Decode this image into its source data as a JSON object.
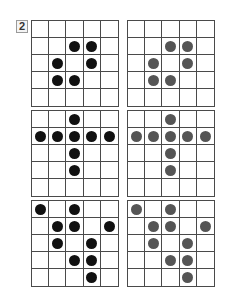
{
  "problem_number": "2",
  "colors": {
    "left_dot": "#111111",
    "right_dot": "#555555",
    "grid_line": "#4a4a4a"
  },
  "rows": [
    {
      "left": {
        "dots": [
          [
            1,
            2
          ],
          [
            1,
            3
          ],
          [
            2,
            1
          ],
          [
            2,
            3
          ],
          [
            3,
            1
          ],
          [
            3,
            2
          ]
        ]
      },
      "right": {
        "dots": [
          [
            1,
            2
          ],
          [
            1,
            3
          ],
          [
            2,
            1
          ],
          [
            2,
            3
          ],
          [
            3,
            1
          ],
          [
            3,
            2
          ]
        ]
      }
    },
    {
      "left": {
        "dots": [
          [
            0,
            2
          ],
          [
            1,
            0
          ],
          [
            1,
            1
          ],
          [
            1,
            2
          ],
          [
            1,
            3
          ],
          [
            1,
            4
          ],
          [
            2,
            2
          ],
          [
            3,
            2
          ]
        ]
      },
      "right": {
        "dots": [
          [
            0,
            2
          ],
          [
            1,
            0
          ],
          [
            1,
            1
          ],
          [
            1,
            2
          ],
          [
            1,
            3
          ],
          [
            1,
            4
          ],
          [
            2,
            2
          ],
          [
            3,
            2
          ]
        ]
      }
    },
    {
      "left": {
        "dots": [
          [
            0,
            0
          ],
          [
            0,
            2
          ],
          [
            1,
            1
          ],
          [
            1,
            2
          ],
          [
            1,
            4
          ],
          [
            2,
            1
          ],
          [
            2,
            3
          ],
          [
            3,
            2
          ],
          [
            3,
            3
          ],
          [
            4,
            3
          ]
        ]
      },
      "right": {
        "dots": [
          [
            0,
            0
          ],
          [
            0,
            2
          ],
          [
            1,
            1
          ],
          [
            1,
            2
          ],
          [
            1,
            4
          ],
          [
            2,
            1
          ],
          [
            2,
            3
          ],
          [
            3,
            2
          ],
          [
            3,
            3
          ],
          [
            4,
            3
          ]
        ]
      }
    }
  ]
}
